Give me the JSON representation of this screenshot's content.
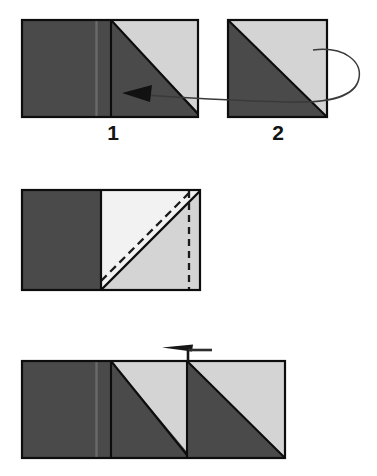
{
  "figure": {
    "background_color": "#ffffff",
    "colors": {
      "dark_fabric": "#4a4a4a",
      "light_fabric": "#d4d4d4",
      "white_fabric": "#f2f2f2",
      "outline": "#0d0d0d",
      "seam_line": "#6a6a6a",
      "arrow": "#3a3a3a",
      "dashed_line": "#1a1a1a",
      "label_text": "#141414"
    }
  },
  "steps": [
    {
      "id": "step-top",
      "description": "Two pieced units shown side by side; curved arrow indicates flipping unit 2 over onto unit 1, right sides together.",
      "pieces": [
        {
          "name": "unit-1",
          "label": "1",
          "x": 22,
          "y": 20,
          "width": 176,
          "height": 97,
          "regions": [
            {
              "name": "left-dark-rectangle",
              "fill": "dark_fabric"
            },
            {
              "name": "right-dark-triangle",
              "fill": "dark_fabric"
            },
            {
              "name": "right-light-triangle",
              "fill": "light_fabric"
            }
          ]
        },
        {
          "name": "unit-2",
          "label": "2",
          "x": 228,
          "y": 20,
          "width": 99,
          "height": 97,
          "regions": [
            {
              "name": "lower-left-dark-triangle",
              "fill": "dark_fabric"
            },
            {
              "name": "upper-right-light-triangle",
              "fill": "light_fabric"
            }
          ]
        }
      ],
      "annotations": [
        {
          "name": "flip-arrow",
          "type": "curved-arrow",
          "direction": "right-to-left",
          "note": "Curls around right edge of unit 2 and points into unit 1"
        }
      ]
    },
    {
      "id": "step-middle",
      "description": "Units layered right sides together. Solid diagonal is the drawn sewing line; dashed diagonal is the stitching guide above it; dashed vertical line marks the side seam allowance.",
      "pieces": [
        {
          "name": "layered-unit",
          "x": 22,
          "y": 190,
          "width": 178,
          "height": 100,
          "regions": [
            {
              "name": "left-dark-rectangle",
              "fill": "dark_fabric"
            },
            {
              "name": "upper-left-white-triangle",
              "fill": "white_fabric"
            },
            {
              "name": "lower-right-light-triangle",
              "fill": "light_fabric"
            }
          ]
        }
      ],
      "annotations": [
        {
          "name": "solid-diagonal-sew-line",
          "type": "solid-line"
        },
        {
          "name": "dashed-diagonal-stitch-line",
          "type": "dashed-line"
        },
        {
          "name": "dashed-vertical-seam-line",
          "type": "dashed-line"
        }
      ]
    },
    {
      "id": "step-bottom",
      "description": "Completed strip with two half-square-triangle units joined to the dark rectangle. Arrow above shows pressing direction toward the left.",
      "pieces": [
        {
          "name": "finished-strip",
          "x": 22,
          "y": 361,
          "width": 263,
          "height": 97,
          "regions": [
            {
              "name": "left-dark-rectangle",
              "fill": "dark_fabric"
            },
            {
              "name": "middle-dark-triangle",
              "fill": "dark_fabric"
            },
            {
              "name": "middle-light-triangle",
              "fill": "light_fabric"
            },
            {
              "name": "right-dark-triangle",
              "fill": "dark_fabric"
            },
            {
              "name": "right-light-triangle",
              "fill": "light_fabric"
            }
          ]
        }
      ],
      "annotations": [
        {
          "name": "press-arrow",
          "type": "straight-arrow",
          "direction": "left",
          "note": "Tapered arrow with a short vertical tail touching the top seam"
        }
      ]
    }
  ]
}
